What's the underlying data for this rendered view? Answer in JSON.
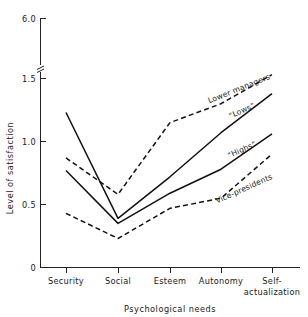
{
  "chart_data": {
    "type": "line",
    "title": "",
    "xlabel": "Psychological needs",
    "ylabel": "Level of satisfaction",
    "categories": [
      "Security",
      "Social",
      "Esteem",
      "Autonomy",
      "Self-actualization"
    ],
    "xtick_labels": [
      {
        "line1": "Security",
        "line2": ""
      },
      {
        "line1": "Social",
        "line2": ""
      },
      {
        "line1": "Esteem",
        "line2": ""
      },
      {
        "line1": "Autonomy",
        "line2": ""
      },
      {
        "line1": "Self-",
        "line2": "actualization"
      }
    ],
    "ylim": [
      0,
      1.6
    ],
    "yticks": [
      "0",
      "0.5",
      "1.0",
      "1.5",
      "6.0"
    ],
    "y_axis_break": true,
    "y_axis_break_note": "axis broken between 1.5 and 6.0",
    "grid": false,
    "legend_position": "inline-annotations",
    "series": [
      {
        "name": "Lower managers",
        "style": "dashed",
        "label": "Lower managers",
        "values": [
          0.87,
          0.58,
          1.15,
          1.3,
          1.53
        ]
      },
      {
        "name": "Lows",
        "style": "solid",
        "label": "“Lows”",
        "values": [
          1.23,
          0.39,
          0.72,
          1.07,
          1.38
        ]
      },
      {
        "name": "Highs",
        "style": "solid",
        "label": "“Highs”",
        "values": [
          0.77,
          0.35,
          0.59,
          0.78,
          1.06
        ]
      },
      {
        "name": "Vice-presidents",
        "style": "dashed",
        "label": "Vice-presidents",
        "values": [
          0.43,
          0.23,
          0.47,
          0.55,
          0.9
        ]
      }
    ],
    "colors": {
      "line": "#111111",
      "axis": "#222222",
      "text": "#1a1a1a",
      "background": "#ffffff"
    }
  },
  "annotations": {
    "lower_managers": "Lower managers",
    "lows": "“Lows”",
    "highs": "“Highs”",
    "vice_presidents": "Vice-presidents"
  },
  "axis": {
    "y_title": "Level of satisfaction",
    "x_title": "Psychological needs",
    "y_tick_0": "0",
    "y_tick_05": "0.5",
    "y_tick_10": "1.0",
    "y_tick_15": "1.5",
    "y_tick_60": "6.0",
    "x_tick_1": "Security",
    "x_tick_2": "Social",
    "x_tick_3": "Esteem",
    "x_tick_4a": "Self-",
    "x_tick_4b": "actualization",
    "x_tick_autonomy": "Autonomy"
  }
}
